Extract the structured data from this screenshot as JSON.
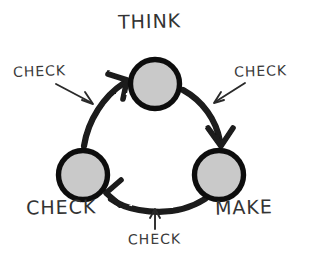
{
  "diagram": {
    "background_color": "#ffffff",
    "node_fill_color": "#c9c9c9",
    "node_stroke_color": "#111111",
    "arrow_color": "#1a1a1a",
    "text_color": "#333333",
    "nodes": [
      {
        "id": "think",
        "label": "THINK",
        "cx": 155,
        "cy": 84,
        "r": 27
      },
      {
        "id": "make",
        "label": "MAKE",
        "cx": 219,
        "cy": 175,
        "r": 27
      },
      {
        "id": "check",
        "label": "CHECK",
        "cx": 83,
        "cy": 175,
        "r": 27
      }
    ],
    "annotations": [
      {
        "id": "check-top-left",
        "label": "CHECK",
        "points_to": "arc-check-to-think"
      },
      {
        "id": "check-top-right",
        "label": "CHECK",
        "points_to": "arc-think-to-make"
      },
      {
        "id": "check-bottom",
        "label": "CHECK",
        "points_to": "arc-make-to-check"
      }
    ],
    "arcs": [
      {
        "id": "arc-check-to-think",
        "from": "check",
        "to": "think",
        "direction": "clockwise"
      },
      {
        "id": "arc-think-to-make",
        "from": "think",
        "to": "make",
        "direction": "clockwise"
      },
      {
        "id": "arc-make-to-check",
        "from": "make",
        "to": "check",
        "direction": "clockwise"
      }
    ]
  }
}
